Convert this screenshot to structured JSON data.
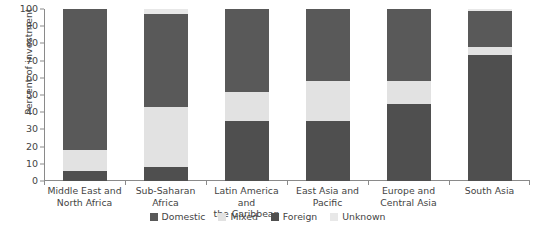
{
  "chart_data": {
    "type": "bar",
    "subtype": "stacked-bar-100",
    "title": "",
    "xlabel": "",
    "ylabel": "Percent of investment",
    "ylim": [
      0,
      100
    ],
    "yticks": [
      0,
      10,
      20,
      30,
      40,
      50,
      60,
      70,
      80,
      90,
      100
    ],
    "ytick_labels": [
      "0",
      "10",
      "20",
      "30",
      "40",
      "50",
      "60",
      "70",
      "80",
      "90",
      "100"
    ],
    "grid": false,
    "legend_position": "bottom-center",
    "categories": [
      "Middle East and North Africa",
      "Sub-Saharan Africa",
      "Latin America and the Caribbean",
      "East Asia and Pacific",
      "Europe and Central Asia",
      "South Asia"
    ],
    "category_lines": [
      [
        "Middle East and",
        "North Africa"
      ],
      [
        "Sub-Saharan",
        "Africa"
      ],
      [
        "Latin America and",
        "the Caribbean"
      ],
      [
        "East Asia and",
        "Pacific"
      ],
      [
        "Europe and",
        "Central Asia"
      ],
      [
        "South Asia"
      ]
    ],
    "stack_order_bottom_to_top": [
      "Foreign",
      "Mixed",
      "Domestic",
      "Unknown"
    ],
    "series": [
      {
        "name": "Foreign",
        "color": "#4f4f4f",
        "values": [
          6,
          8,
          35,
          35,
          45,
          73
        ]
      },
      {
        "name": "Mixed",
        "color": "#e2e2e2",
        "values": [
          12,
          35,
          17,
          23,
          13,
          5
        ]
      },
      {
        "name": "Domestic",
        "color": "#595959",
        "values": [
          82,
          54,
          48,
          42,
          42,
          21
        ]
      },
      {
        "name": "Unknown",
        "color": "#e8e8e8",
        "values": [
          0,
          3,
          0,
          0,
          0,
          1
        ]
      }
    ],
    "legend": [
      {
        "label": "Domestic",
        "color": "#595959"
      },
      {
        "label": "Mixed",
        "color": "#e2e2e2"
      },
      {
        "label": "Foreign",
        "color": "#4f4f4f"
      },
      {
        "label": "Unknown",
        "color": "#e8e8e8"
      }
    ]
  }
}
